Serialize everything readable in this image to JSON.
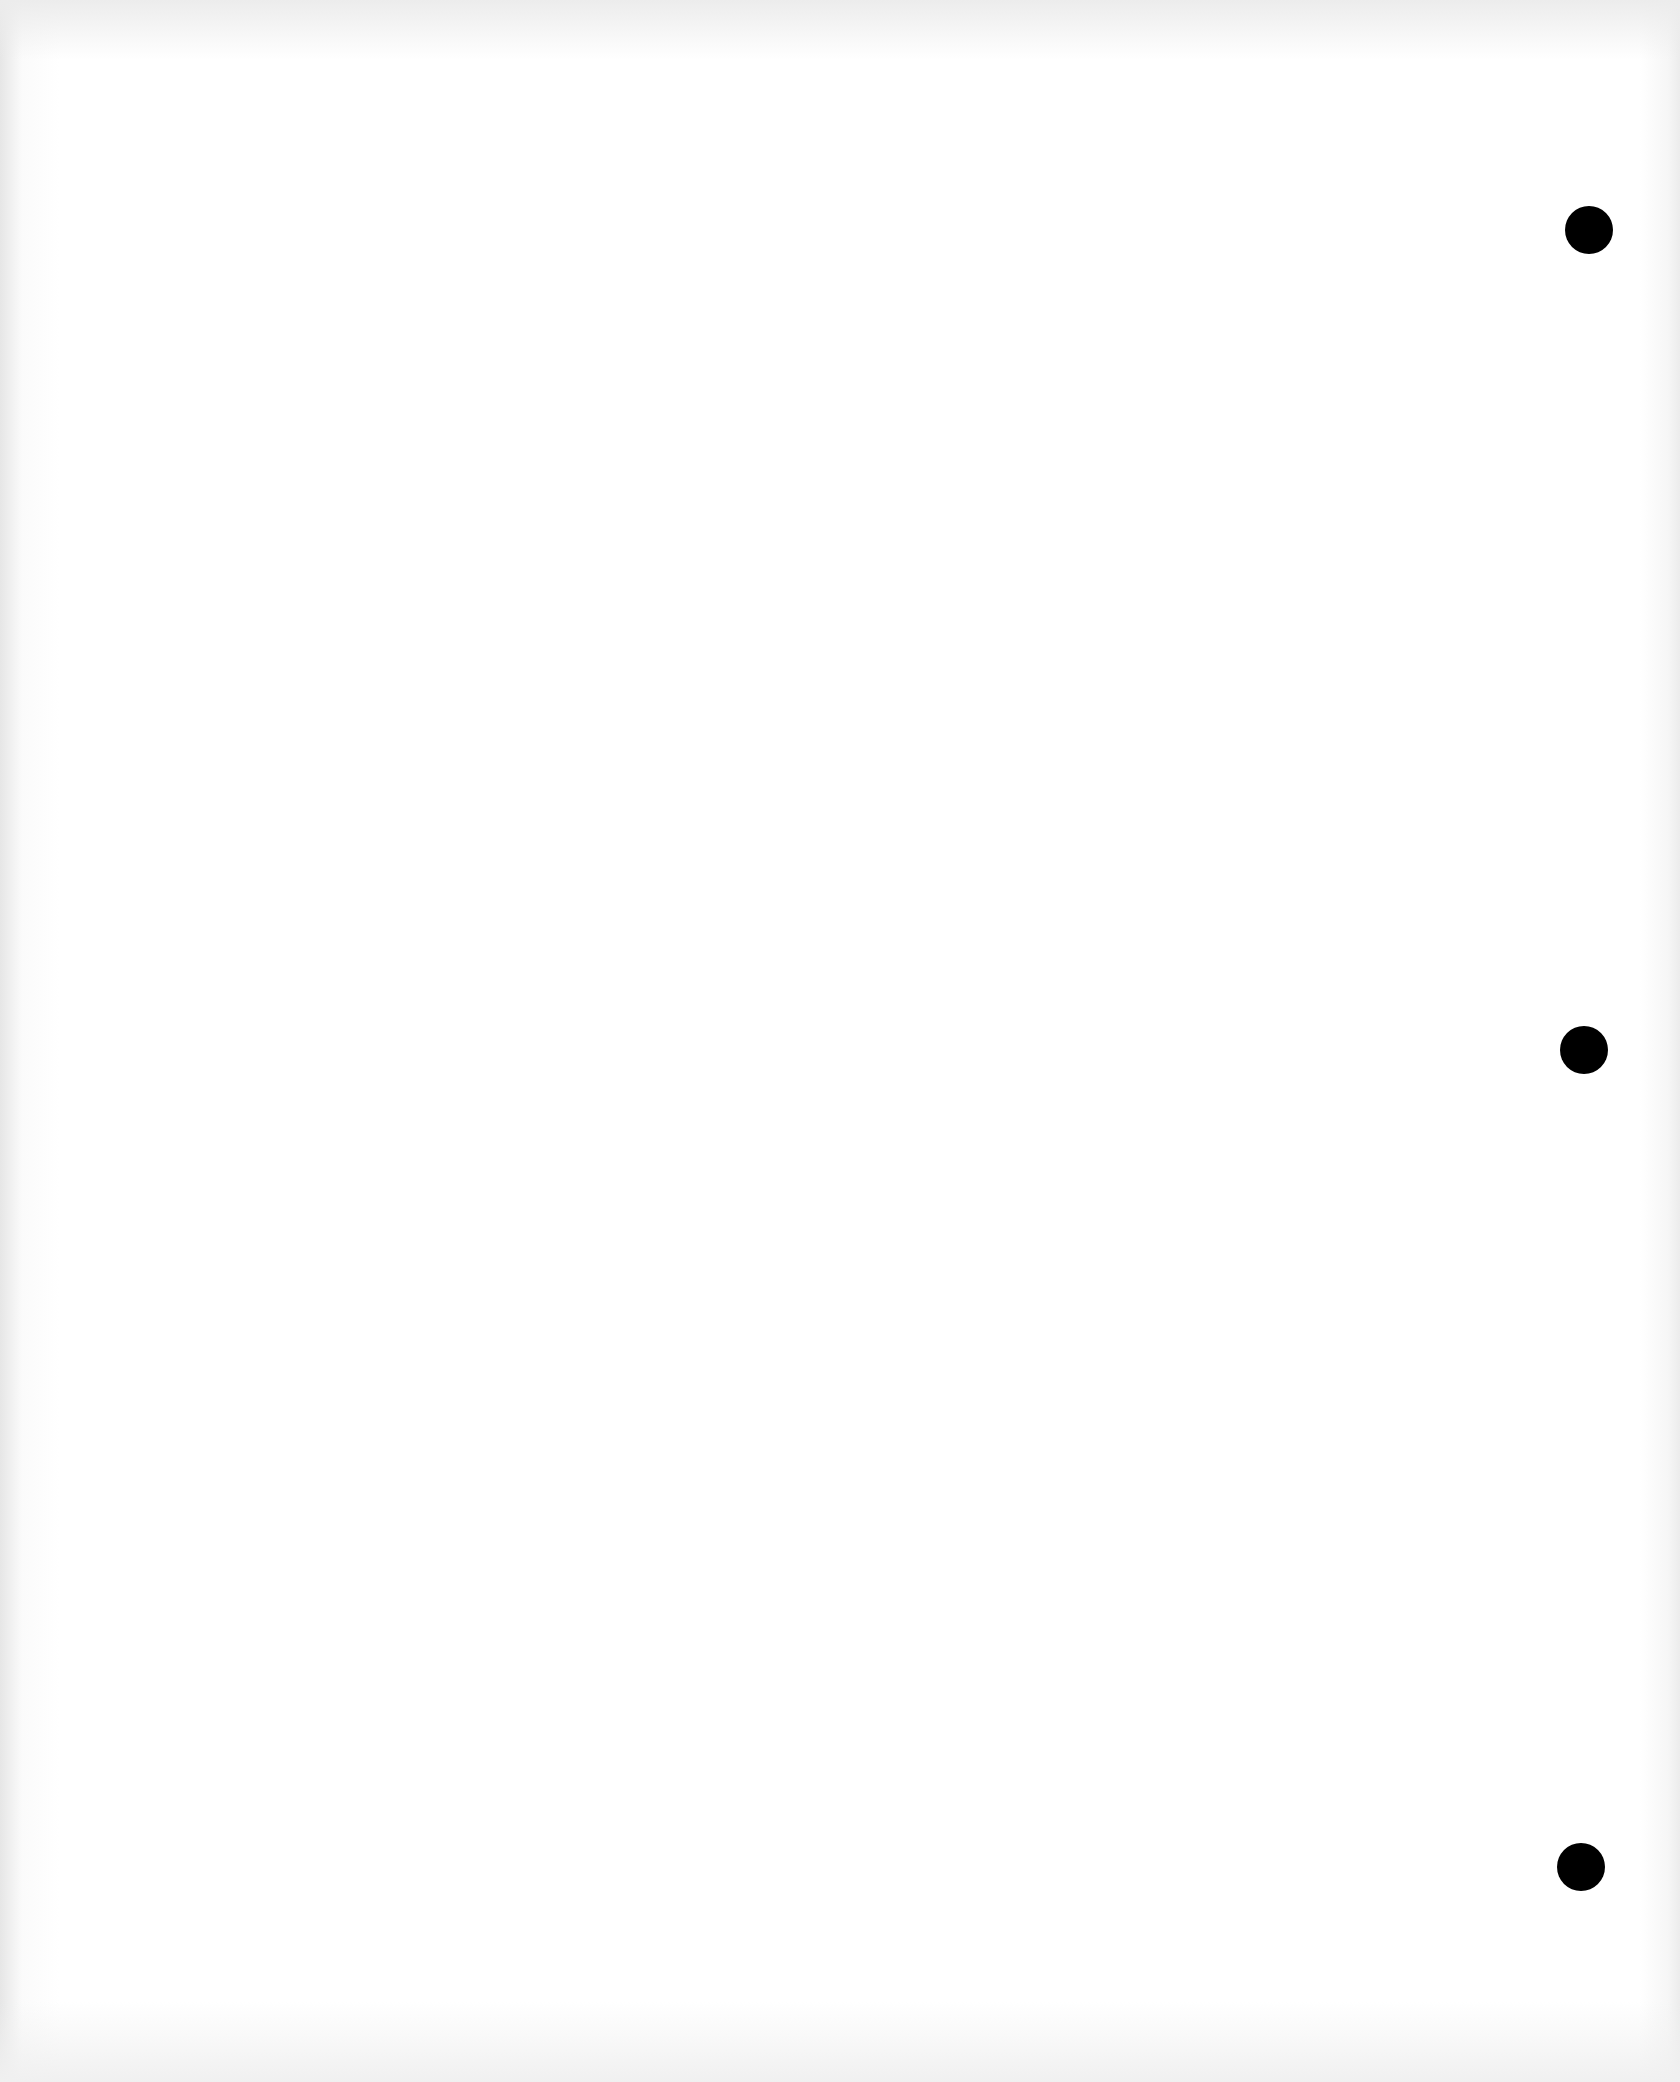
{
  "page": {
    "type": "blank scanned sheet",
    "background_color": "#ffffff",
    "punch_holes": [
      {
        "cx": 1589,
        "cy": 230,
        "color": "#000000"
      },
      {
        "cx": 1584,
        "cy": 1050,
        "color": "#000000"
      },
      {
        "cx": 1581,
        "cy": 1867,
        "color": "#000000"
      }
    ]
  }
}
